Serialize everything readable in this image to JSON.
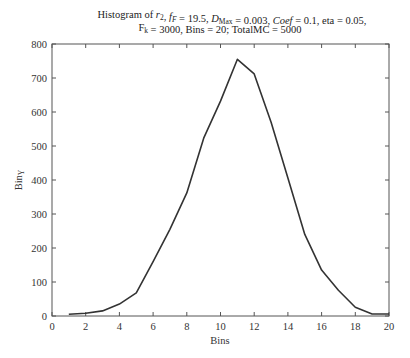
{
  "title": {
    "line1_parts": [
      {
        "text": "Histogram of ",
        "style": "normal"
      },
      {
        "text": "r",
        "style": "italic"
      },
      {
        "text": "2",
        "style": "sub"
      },
      {
        "text": ", ",
        "style": "normal"
      },
      {
        "text": "f",
        "style": "italic"
      },
      {
        "text": "F",
        "style": "sub-italic"
      },
      {
        "text": " = 19.5,  ",
        "style": "normal"
      },
      {
        "text": "D",
        "style": "italic"
      },
      {
        "text": "Max",
        "style": "sub"
      },
      {
        "text": " = 0.003, ",
        "style": "normal"
      },
      {
        "text": "Coef",
        "style": "italic"
      },
      {
        "text": " = 0.1, eta = 0.05,",
        "style": "normal"
      }
    ],
    "line2_parts": [
      {
        "text": "F",
        "style": "normal"
      },
      {
        "text": "k",
        "style": "sub"
      },
      {
        "text": " = 3000, Bins = 20; TotalMC = 5000",
        "style": "normal"
      }
    ]
  },
  "chart_data": {
    "type": "line",
    "title": "Histogram of r2, fF = 19.5, DMax = 0.003, Coef = 0.1, eta = 0.05, Fk = 3000, Bins = 20; TotalMC = 5000",
    "xlabel": "Bins",
    "ylabel": "Bin_Y",
    "xlim": [
      0,
      20
    ],
    "ylim": [
      0,
      800
    ],
    "xticks": [
      0,
      2,
      4,
      6,
      8,
      10,
      12,
      14,
      16,
      18,
      20
    ],
    "yticks": [
      0,
      100,
      200,
      300,
      400,
      500,
      600,
      700,
      800
    ],
    "grid": false,
    "legend": null,
    "x": [
      1,
      2,
      3,
      4,
      5,
      6,
      7,
      8,
      9,
      10,
      11,
      12,
      13,
      14,
      15,
      16,
      17,
      18,
      19,
      20
    ],
    "values": [
      5,
      8,
      15,
      35,
      68,
      160,
      255,
      362,
      523,
      632,
      755,
      712,
      570,
      406,
      240,
      135,
      76,
      26,
      6,
      6
    ],
    "line_color": "#333333"
  }
}
